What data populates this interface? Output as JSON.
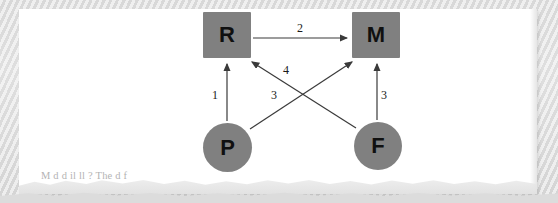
{
  "page": {
    "type": "scanned-book-page-fragment",
    "background_color": "#dedede",
    "sheet_color": "#ffffff"
  },
  "diagram": {
    "title": "",
    "node_fill_color": "#808080",
    "node_text_color": "#101010",
    "arrow_color": "#3a3a3a",
    "nodes": [
      {
        "id": "R",
        "label": "R",
        "shape": "square",
        "x": 203,
        "y": 12,
        "w": 48,
        "h": 46
      },
      {
        "id": "M",
        "label": "M",
        "shape": "square",
        "x": 352,
        "y": 12,
        "w": 48,
        "h": 46
      },
      {
        "id": "P",
        "label": "P",
        "shape": "circle",
        "x": 203,
        "y": 123,
        "w": 49,
        "h": 49
      },
      {
        "id": "F",
        "label": "F",
        "shape": "circle",
        "x": 354,
        "y": 122,
        "w": 48,
        "h": 48
      }
    ],
    "edges": [
      {
        "id": "e2",
        "label": "2",
        "from": "R",
        "to": "M",
        "label_x": 297,
        "label_y": 22
      },
      {
        "id": "e1",
        "label": "1",
        "from": "P",
        "to": "R",
        "label_x": 212,
        "label_y": 90
      },
      {
        "id": "e3v",
        "label": "3",
        "from": "F",
        "to": "M",
        "label_x": 381,
        "label_y": 90
      },
      {
        "id": "e4",
        "label": "4",
        "from": "F",
        "to": "R",
        "label_x": 283,
        "label_y": 66
      },
      {
        "id": "e3d",
        "label": "3",
        "from": "P",
        "to": "M",
        "label_x": 272,
        "label_y": 91
      }
    ]
  },
  "body_text": {
    "faded_line": "M                  d            d          il                    ll                            ?  The                 d        f"
  }
}
